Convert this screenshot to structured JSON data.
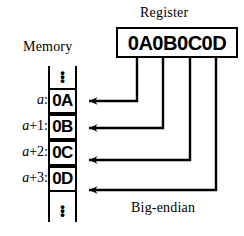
{
  "figure": {
    "caption": "Big-endian",
    "register": {
      "title": "Register",
      "value": "0A0B0C0D"
    },
    "memory": {
      "title": "Memory",
      "ellipsis_top": "⋮",
      "ellipsis_bottom": "⋮",
      "cells": [
        {
          "address": "a",
          "address_base": "a",
          "address_offset": "",
          "value": "0A"
        },
        {
          "address": "a+1",
          "address_base": "a",
          "address_offset": "+1",
          "value": "0B"
        },
        {
          "address": "a+2",
          "address_base": "a",
          "address_offset": "+2",
          "value": "0C"
        },
        {
          "address": "a+3",
          "address_base": "a",
          "address_offset": "+3",
          "value": "0D"
        }
      ],
      "address_separator": ":"
    },
    "mapping": [
      {
        "register_byte": "0A",
        "byte_index": 0,
        "memory_address": "a"
      },
      {
        "register_byte": "0B",
        "byte_index": 1,
        "memory_address": "a+1"
      },
      {
        "register_byte": "0C",
        "byte_index": 2,
        "memory_address": "a+2"
      },
      {
        "register_byte": "0D",
        "byte_index": 3,
        "memory_address": "a+3"
      }
    ],
    "colors": {
      "stroke": "#000000",
      "background": "#ffffff"
    }
  }
}
